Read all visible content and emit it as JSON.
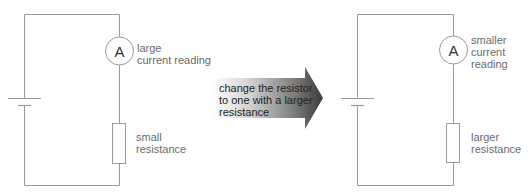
{
  "diagram": {
    "colors": {
      "wire": "#9a9a9a",
      "label_text": "#6a6a6a",
      "arrow_gradient_start": "#ffffff",
      "arrow_gradient_end": "#3a3a3a"
    },
    "left_circuit": {
      "ammeter_symbol": "A",
      "ammeter_label": "large\ncurrent reading",
      "resistor_label": "small\nresistance"
    },
    "transition_arrow": {
      "label": "change the resistor\nto one with a larger\nresistance"
    },
    "right_circuit": {
      "ammeter_symbol": "A",
      "ammeter_label": "smaller\ncurrent\nreading",
      "resistor_label": "larger\nresistance"
    }
  }
}
